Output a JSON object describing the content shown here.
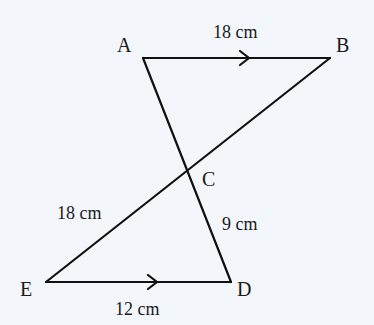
{
  "diagram": {
    "background": "#f3f6fa",
    "line_color": "#111111",
    "points": {
      "A": {
        "label": "A",
        "x": 143,
        "y": 58
      },
      "B": {
        "label": "B",
        "x": 330,
        "y": 58
      },
      "C": {
        "label": "C",
        "x": 186,
        "y": 171
      },
      "D": {
        "label": "D",
        "x": 231,
        "y": 282
      },
      "E": {
        "label": "E",
        "x": 46,
        "y": 282
      }
    },
    "segments": [
      {
        "from": "A",
        "to": "B",
        "parallel_arrow": true
      },
      {
        "from": "E",
        "to": "D",
        "parallel_arrow": true
      },
      {
        "from": "A",
        "to": "D"
      },
      {
        "from": "B",
        "to": "E"
      }
    ],
    "measurements": {
      "AB": "18 cm",
      "CE": "18 cm",
      "CD": "9 cm",
      "ED": "12 cm"
    }
  }
}
